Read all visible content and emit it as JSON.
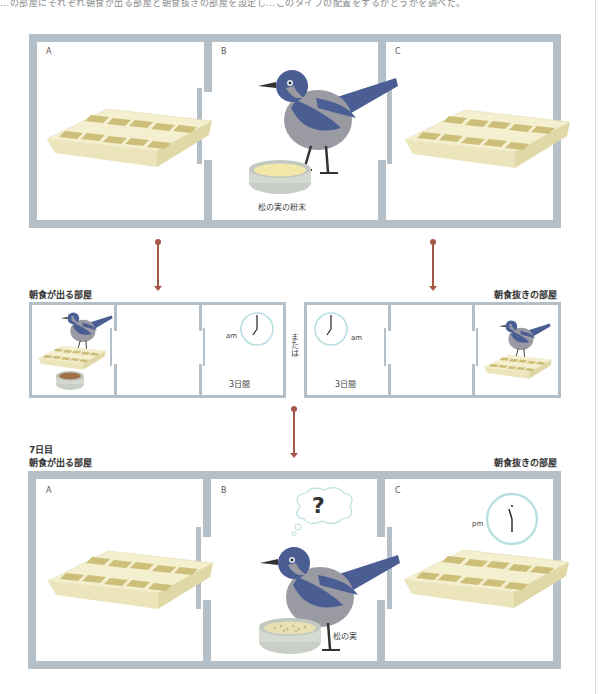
{
  "top_caption": "…の部屋にそれぞれ朝食が出る部屋と朝食抜きの部屋を設定し…このタイプの配置をするかどうかを調べた。",
  "panel_top": {
    "rooms": [
      {
        "letter": "A",
        "content": "ice-cube-tray"
      },
      {
        "letter": "B",
        "content": "jay-bird",
        "bowl_label": "松の実の粉末"
      },
      {
        "letter": "C",
        "content": "ice-cube-tray"
      }
    ]
  },
  "panel_mid_left": {
    "heading": "朝食が出る部屋",
    "clock_label": "am",
    "duration": "3日間"
  },
  "or_label": "または",
  "panel_mid_right": {
    "heading": "朝食抜きの部屋",
    "clock_label": "am",
    "duration": "3日間"
  },
  "panel_bottom": {
    "day_label": "7日目",
    "heading_left": "朝食が出る部屋",
    "heading_right": "朝食抜きの部屋",
    "rooms": [
      {
        "letter": "A",
        "content": "ice-cube-tray"
      },
      {
        "letter": "B",
        "content": "jay-bird",
        "thought": "?",
        "bowl_label": "松の実"
      },
      {
        "letter": "C",
        "content": "ice-cube-tray",
        "clock_label": "pm"
      }
    ]
  },
  "colors": {
    "wall": "#b5bfc7",
    "arrow": "#a65848",
    "clock_ring": "#b9dfe0",
    "tray": "#efe9c2",
    "bird_blue": "#4a5e94",
    "bird_gray": "#9a9aa3"
  }
}
